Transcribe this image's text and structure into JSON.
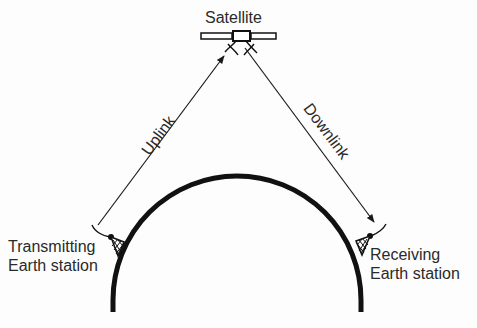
{
  "diagram": {
    "nodes": {
      "satellite": {
        "label": "Satellite",
        "icon": "satellite-icon"
      },
      "transmitter": {
        "label_line1": "Transmitting",
        "label_line2": "Earth station",
        "icon": "antenna-tower-icon"
      },
      "receiver": {
        "label_line1": "Receiving",
        "label_line2": "Earth station",
        "icon": "antenna-tower-icon"
      }
    },
    "edges": {
      "uplink": {
        "label": "Uplink",
        "from": "Transmitting Earth station",
        "to": "Satellite"
      },
      "downlink": {
        "label": "Downlink",
        "from": "Satellite",
        "to": "Receiving Earth station"
      }
    },
    "earth": {
      "shape": "arc",
      "label": ""
    },
    "colors": {
      "line": "#1a1a1a",
      "text": "#2a2a2a",
      "background": "#fdfdfd"
    }
  }
}
